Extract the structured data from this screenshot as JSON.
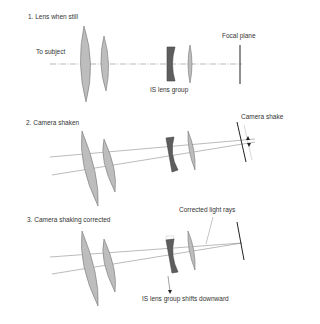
{
  "panels": [
    {
      "title": "1. Lens when still",
      "labels": {
        "subject": "To subject",
        "is_group": "IS lens group",
        "focal_plane": "Focal plane"
      }
    },
    {
      "title": "2. Camera shaken",
      "labels": {
        "shake": "Camera shake"
      }
    },
    {
      "title": "3. Camera shaking corrected",
      "labels": {
        "corrected": "Corrected light rays",
        "shift": "IS lens group shifts downward"
      }
    }
  ],
  "colors": {
    "lens_fill": "#bdbdbd",
    "is_lens_fill": "#5e5e5e",
    "outline": "#555555",
    "ray": "#777777",
    "focal_plane": "#222222"
  }
}
